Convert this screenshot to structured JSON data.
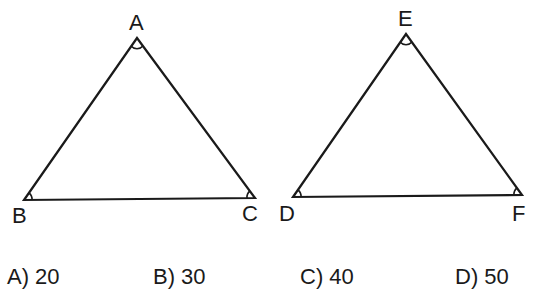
{
  "figure": {
    "triangle1": {
      "vertices": {
        "A": {
          "label": "A",
          "x": 137,
          "y": 38
        },
        "B": {
          "label": "B",
          "x": 24,
          "y": 200
        },
        "C": {
          "label": "C",
          "x": 255,
          "y": 198
        }
      }
    },
    "triangle2": {
      "vertices": {
        "E": {
          "label": "E",
          "x": 406,
          "y": 34
        },
        "D": {
          "label": "D",
          "x": 293,
          "y": 197
        },
        "F": {
          "label": "F",
          "x": 522,
          "y": 195
        }
      }
    },
    "stroke_color": "#1a1a1a"
  },
  "options": [
    {
      "label": "A) 20"
    },
    {
      "label": "B) 30"
    },
    {
      "label": "C) 40"
    },
    {
      "label": "D) 50"
    }
  ]
}
